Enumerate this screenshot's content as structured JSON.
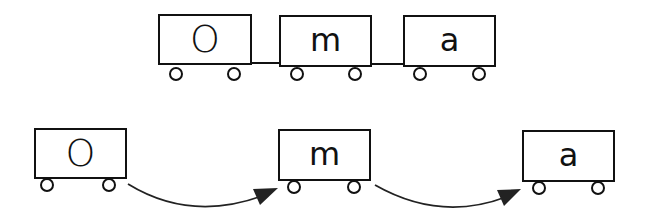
{
  "colors": {
    "stroke": "#111111",
    "background": "#ffffff"
  },
  "top_train": {
    "label": "coupled-train",
    "cars": [
      {
        "letter": "O"
      },
      {
        "letter": "m"
      },
      {
        "letter": "a"
      }
    ]
  },
  "bottom_train": {
    "label": "separated-cars-with-arrows",
    "cars": [
      {
        "letter": "O"
      },
      {
        "letter": "m"
      },
      {
        "letter": "a"
      }
    ],
    "arrows": [
      {
        "from": "O",
        "to": "m"
      },
      {
        "from": "m",
        "to": "a"
      }
    ]
  }
}
